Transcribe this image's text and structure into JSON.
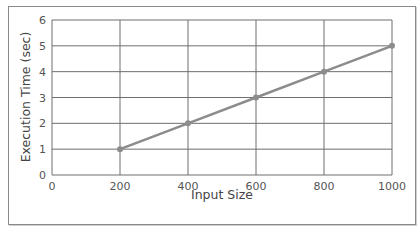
{
  "chart_data": {
    "type": "line",
    "title": "",
    "xlabel": "Input Size",
    "ylabel": "Execution Time (sec)",
    "x": [
      200,
      400,
      600,
      800,
      1000
    ],
    "series": [
      {
        "name": "Execution Time",
        "values": [
          1,
          2,
          3,
          4,
          5
        ],
        "color": "#8c8c8c"
      }
    ],
    "xlim": [
      0,
      1000
    ],
    "ylim": [
      0,
      6
    ],
    "xticks": [
      "0",
      "200",
      "400",
      "600",
      "800",
      "1000"
    ],
    "yticks": [
      "0",
      "1",
      "2",
      "3",
      "4",
      "5",
      "6"
    ],
    "grid": true,
    "legend": "none"
  }
}
